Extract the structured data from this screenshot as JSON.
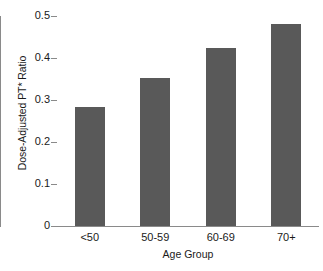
{
  "chart_data": {
    "type": "bar",
    "title": "",
    "subtitle": "",
    "xlabel": "Age Group",
    "ylabel": "Dose-Adjusted PT* Ratio",
    "categories": [
      "<50",
      "50-59",
      "60-69",
      "70+"
    ],
    "values": [
      0.283,
      0.352,
      0.424,
      0.481
    ],
    "series": [
      {
        "name": "Dose-Adjusted PT* Ratio",
        "values": [
          0.283,
          0.352,
          0.424,
          0.481
        ]
      }
    ],
    "ylim": [
      0,
      0.5
    ],
    "ytick_labels": [
      "0.5",
      "0.4",
      "0.3",
      "0.2",
      "0.1",
      "0"
    ],
    "ytick_values": [
      0.5,
      0.4,
      0.3,
      0.2,
      0.1,
      0
    ],
    "grid": false,
    "legend": false,
    "legend_position": "none",
    "bar_color": "#595959",
    "axis_color": "#8a8a8a",
    "background_color": "#ffffff",
    "annotations": []
  }
}
